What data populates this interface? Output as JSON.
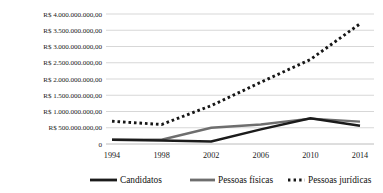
{
  "chart_data": {
    "type": "line",
    "title": "",
    "subtitle": "",
    "xlabel": "",
    "ylabel": "",
    "x": [
      1994,
      1998,
      2002,
      2006,
      2010,
      2014
    ],
    "xticklabels": [
      "1994",
      "1998",
      "2002",
      "2006",
      "2010",
      "2014"
    ],
    "xlim": [
      1994,
      2014
    ],
    "ylim": [
      0,
      4000000000
    ],
    "yticks": [
      0,
      500000000,
      1000000000,
      1500000000,
      2000000000,
      2500000000,
      3000000000,
      3500000000,
      4000000000
    ],
    "yticklabels": [
      "0",
      "R$ 500.000.000,00",
      "R$ 1.000.000.000,00",
      "R$ 1.500.000.000,00",
      "R$ 2.000.000.000,00",
      "R$ 2.500.000.000,00",
      "R$ 3.000.000.000,00",
      "R$ 3.500.000.000,00",
      "R$ 4.000.000.000,00"
    ],
    "grid": true,
    "grid_axis": "y",
    "legend_position": "bottom",
    "currency_symbol": "R$",
    "series": [
      {
        "name": "Candidatos",
        "style": "solid",
        "color": "#1b1b1b",
        "values": [
          130000000,
          110000000,
          80000000,
          450000000,
          790000000,
          560000000
        ]
      },
      {
        "name": "Pessoas físicas",
        "style": "solid",
        "color": "#6e6e6e",
        "values": [
          135000000,
          130000000,
          500000000,
          600000000,
          780000000,
          690000000
        ]
      },
      {
        "name": "Pessoas jurídicas",
        "style": "dotted",
        "color": "#161616",
        "values": [
          700000000,
          600000000,
          1180000000,
          1900000000,
          2600000000,
          3700000000
        ]
      }
    ]
  },
  "legend": {
    "items": [
      {
        "label": "Candidatos"
      },
      {
        "label": "Pessoas físicas"
      },
      {
        "label": "Pessoas jurídicas"
      }
    ]
  }
}
